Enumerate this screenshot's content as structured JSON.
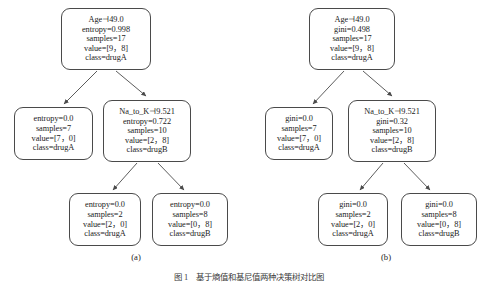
{
  "figure": {
    "caption_label": "图",
    "caption_number": "1",
    "caption_text": "基于熵值和基尼值两种决策树对比图",
    "background_color": "#ffffff",
    "node_border_color": "#4a4a4a",
    "text_color": "#1b1b1b"
  },
  "subfigures": [
    {
      "id": "a",
      "label": "(a)",
      "criterion": "entropy",
      "nodes": [
        {
          "id": "root",
          "role": "decision",
          "lines": [
            "Age⊣49.0",
            "entropy=0.998",
            "samples=17",
            "value=[9，8]",
            "class=drugA"
          ],
          "condition": "Age⊣49.0",
          "impurity_label": "entropy",
          "impurity": "0.998",
          "samples": "17",
          "value": "[9，8]",
          "class": "drugA"
        },
        {
          "id": "leaf-l",
          "role": "leaf",
          "lines": [
            "entropy=0.0",
            "samples=7",
            "value=[7，0]",
            "class=drugA"
          ],
          "impurity_label": "entropy",
          "impurity": "0.0",
          "samples": "7",
          "value": "[7，0]",
          "class": "drugA"
        },
        {
          "id": "node-r",
          "role": "decision",
          "lines": [
            "Na_to_K⊣9.521",
            "entropy=0.722",
            "samples=10",
            "value=[2，8]",
            "class=drugB"
          ],
          "condition": "Na_to_K⊣9.521",
          "impurity_label": "entropy",
          "impurity": "0.722",
          "samples": "10",
          "value": "[2，8]",
          "class": "drugB"
        },
        {
          "id": "leaf-rl",
          "role": "leaf",
          "lines": [
            "entropy=0.0",
            "samples=2",
            "value=[2，0]",
            "class=drugA"
          ],
          "impurity_label": "entropy",
          "impurity": "0.0",
          "samples": "2",
          "value": "[2，0]",
          "class": "drugA"
        },
        {
          "id": "leaf-rr",
          "role": "leaf",
          "lines": [
            "entropy=0.0",
            "samples=8",
            "value=[0，8]",
            "class=drugB"
          ],
          "impurity_label": "entropy",
          "impurity": "0.0",
          "samples": "8",
          "value": "[0，8]",
          "class": "drugB"
        }
      ]
    },
    {
      "id": "b",
      "label": "(b)",
      "criterion": "gini",
      "nodes": [
        {
          "id": "root",
          "role": "decision",
          "lines": [
            "Age⊣49.0",
            "gini=0.498",
            "samples=17",
            "value=[9，8]",
            "class=drugA"
          ],
          "condition": "Age⊣49.0",
          "impurity_label": "gini",
          "impurity": "0.498",
          "samples": "17",
          "value": "[9，8]",
          "class": "drugA"
        },
        {
          "id": "leaf-l",
          "role": "leaf",
          "lines": [
            "gini=0.0",
            "samples=7",
            "value=[7，0]",
            "class=drugA"
          ],
          "impurity_label": "gini",
          "impurity": "0.0",
          "samples": "7",
          "value": "[7，0]",
          "class": "drugA"
        },
        {
          "id": "node-r",
          "role": "decision",
          "lines": [
            "Na_to_K⊣9.521",
            "gini=0.32",
            "samples=10",
            "value=[2，8]",
            "class=drugB"
          ],
          "condition": "Na_to_K⊣9.521",
          "impurity_label": "gini",
          "impurity": "0.32",
          "samples": "10",
          "value": "[2，8]",
          "class": "drugB"
        },
        {
          "id": "leaf-rl",
          "role": "leaf",
          "lines": [
            "gini=0.0",
            "samples=2",
            "value=[2，0]",
            "class=drugA"
          ],
          "impurity_label": "gini",
          "impurity": "0.0",
          "samples": "2",
          "value": "[2，0]",
          "class": "drugA"
        },
        {
          "id": "leaf-rr",
          "role": "leaf",
          "lines": [
            "gini=0.0",
            "samples=8",
            "value=[0，8]",
            "class=drugB"
          ],
          "impurity_label": "gini",
          "impurity": "0.0",
          "samples": "8",
          "value": "[0，8]",
          "class": "drugB"
        }
      ]
    }
  ]
}
